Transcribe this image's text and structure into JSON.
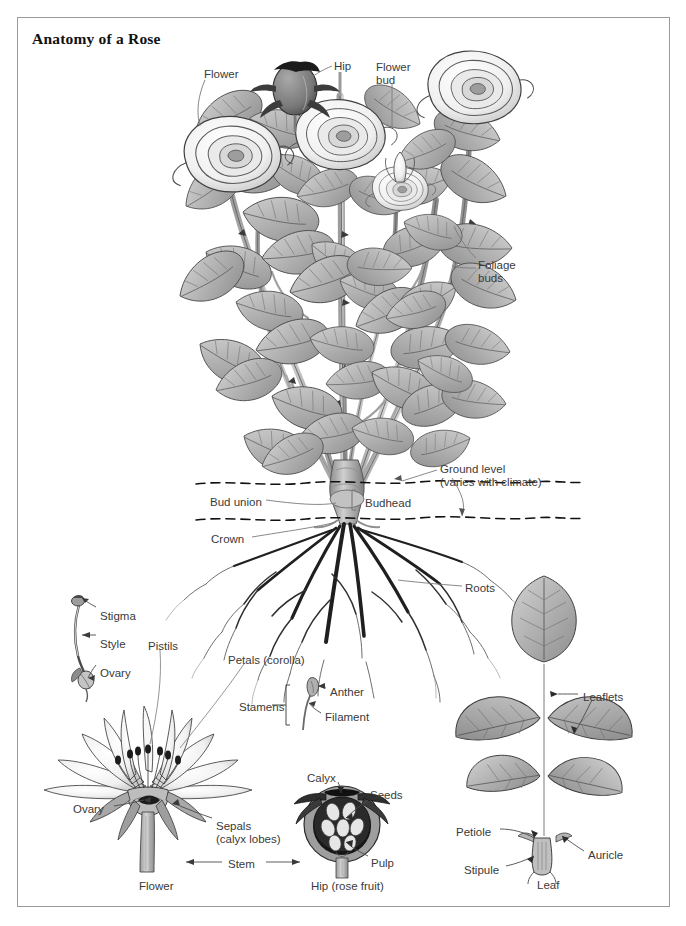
{
  "document": {
    "title": "Anatomy of a Rose",
    "type": "botanical-diagram",
    "subject": "Rose (Rosa) plant anatomy",
    "style": "grayscale line illustration with leader-line callouts"
  },
  "colors": {
    "border": "#9a9a9a",
    "background": "#ffffff",
    "label_text": "#3a3a3a",
    "title_text": "#111111",
    "leader_line": "#7a7a7a",
    "ink_dark": "#2b2b2b",
    "ink_mid": "#8c8c8c",
    "ink_light": "#c8c8c8",
    "leaf_fill": "#b4b4b4",
    "petal_fill": "#f2f2f2",
    "hip_fill": "#8a8a8a",
    "root_dark": "#1f1f1f"
  },
  "panels": {
    "whole_plant": {
      "name": "whole-plant",
      "labels": [
        {
          "key": "flower",
          "text": "Flower",
          "x": 204,
          "y": 68
        },
        {
          "key": "hip",
          "text": "Hip",
          "x": 334,
          "y": 60
        },
        {
          "key": "flower_bud",
          "text": "Flower\nbud",
          "x": 376,
          "y": 61
        },
        {
          "key": "foliage_buds",
          "text": "Foliage\nbuds",
          "x": 478,
          "y": 259
        },
        {
          "key": "ground_level",
          "text": "Ground level\n(varies with climate)",
          "x": 440,
          "y": 463
        },
        {
          "key": "bud_union",
          "text": "Bud union",
          "x": 210,
          "y": 496
        },
        {
          "key": "budhead",
          "text": "Budhead",
          "x": 365,
          "y": 497
        },
        {
          "key": "crown",
          "text": "Crown",
          "x": 211,
          "y": 533
        },
        {
          "key": "roots",
          "text": "Roots",
          "x": 465,
          "y": 582
        }
      ],
      "ground_lines": [
        {
          "name": "upper-soil-line",
          "y": 483
        },
        {
          "name": "lower-soil-line",
          "y": 519
        }
      ]
    },
    "pistil_detail": {
      "name": "pistil-detail",
      "labels": [
        {
          "key": "stigma",
          "text": "Stigma",
          "x": 100,
          "y": 610
        },
        {
          "key": "style",
          "text": "Style",
          "x": 100,
          "y": 638
        },
        {
          "key": "ovary",
          "text": "Ovary",
          "x": 100,
          "y": 667
        }
      ]
    },
    "flower_section": {
      "name": "flower-cross-section",
      "caption": "Flower",
      "caption_x": 139,
      "caption_y": 880,
      "labels": [
        {
          "key": "pistils",
          "text": "Pistils",
          "x": 148,
          "y": 640
        },
        {
          "key": "petals",
          "text": "Petals (corolla)",
          "x": 228,
          "y": 654
        },
        {
          "key": "stamens",
          "text": "Stamens",
          "x": 239,
          "y": 701
        },
        {
          "key": "anther",
          "text": "Anther",
          "x": 330,
          "y": 686
        },
        {
          "key": "filament",
          "text": "Filament",
          "x": 325,
          "y": 711
        },
        {
          "key": "ovary_section",
          "text": "Ovary",
          "x": 73,
          "y": 803
        },
        {
          "key": "sepals",
          "text": "Sepals\n(calyx lobes)",
          "x": 216,
          "y": 820
        },
        {
          "key": "stem",
          "text": "Stem",
          "x": 228,
          "y": 858
        }
      ]
    },
    "hip_section": {
      "name": "hip-cross-section",
      "caption": "Hip (rose fruit)",
      "caption_x": 311,
      "caption_y": 880,
      "labels": [
        {
          "key": "calyx",
          "text": "Calyx",
          "x": 307,
          "y": 772
        },
        {
          "key": "seeds",
          "text": "Seeds",
          "x": 370,
          "y": 789
        },
        {
          "key": "pulp",
          "text": "Pulp",
          "x": 371,
          "y": 857
        }
      ]
    },
    "leaf_detail": {
      "name": "leaf-detail",
      "caption": "Leaf",
      "caption_x": 537,
      "caption_y": 879,
      "labels": [
        {
          "key": "leaflets",
          "text": "Leaflets",
          "x": 583,
          "y": 691
        },
        {
          "key": "petiole",
          "text": "Petiole",
          "x": 456,
          "y": 826
        },
        {
          "key": "auricle",
          "text": "Auricle",
          "x": 588,
          "y": 849
        },
        {
          "key": "stipule",
          "text": "Stipule",
          "x": 464,
          "y": 864
        }
      ]
    }
  }
}
